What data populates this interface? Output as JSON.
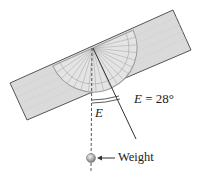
{
  "diagram": {
    "type": "physics-illustration",
    "angle_label": {
      "variable": "E",
      "equals": " = ",
      "value": "28°",
      "full_text": "E = 28°"
    },
    "arc_label": "E",
    "weight_label": "Weight",
    "angle_degrees": 28,
    "colors": {
      "board_fill": "#d9d9d9",
      "board_stroke": "#555555",
      "protractor_stroke": "#9a9a9a",
      "line": "#333333",
      "weight": "#9a9a9a",
      "text": "#222222"
    }
  }
}
